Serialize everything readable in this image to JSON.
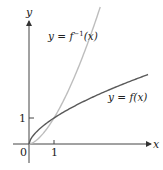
{
  "chart_data": {
    "type": "line",
    "title": "",
    "xlabel": "x",
    "ylabel": "y",
    "x_ticks": [
      {
        "value": 0,
        "label": "0"
      },
      {
        "value": 1,
        "label": "1"
      }
    ],
    "y_ticks": [
      {
        "value": 1,
        "label": "1"
      }
    ],
    "xlim": [
      -0.65,
      5.1
    ],
    "ylim": [
      -0.75,
      4.75
    ],
    "grid": false,
    "legend": "inline annotations",
    "series": [
      {
        "name": "y = f(x)",
        "color": "#555555",
        "function": "x^0.63",
        "x": [
          0,
          0.25,
          0.5,
          1,
          1.5,
          2,
          2.5,
          3,
          3.5,
          4,
          4.5,
          4.76
        ],
        "y": [
          0,
          0.42,
          0.65,
          1,
          1.29,
          1.55,
          1.78,
          2.0,
          2.2,
          2.39,
          2.58,
          2.67
        ]
      },
      {
        "name": "y = f^{-1}(x)",
        "color": "#bbbbbb",
        "function": "x^1.587",
        "x": [
          0,
          0.25,
          0.5,
          1,
          1.5,
          2,
          2.5,
          2.85
        ],
        "y": [
          0,
          0.11,
          0.33,
          1,
          1.9,
          3.0,
          4.28,
          4.6
        ]
      }
    ],
    "annotations": [
      {
        "text": "y = f⁻¹(x)",
        "near_series": "y = f^{-1}(x)"
      },
      {
        "text": "y = f(x)",
        "near_series": "y = f(x)"
      }
    ]
  },
  "labels": {
    "y_axis": "y",
    "x_axis": "x",
    "origin": "0",
    "x_tick_1": "1",
    "y_tick_1": "1",
    "inverse_label_prefix": "y = f",
    "inverse_label_sup": "−1",
    "inverse_label_suffix": "(x)",
    "f_label": "y = f(x)"
  }
}
